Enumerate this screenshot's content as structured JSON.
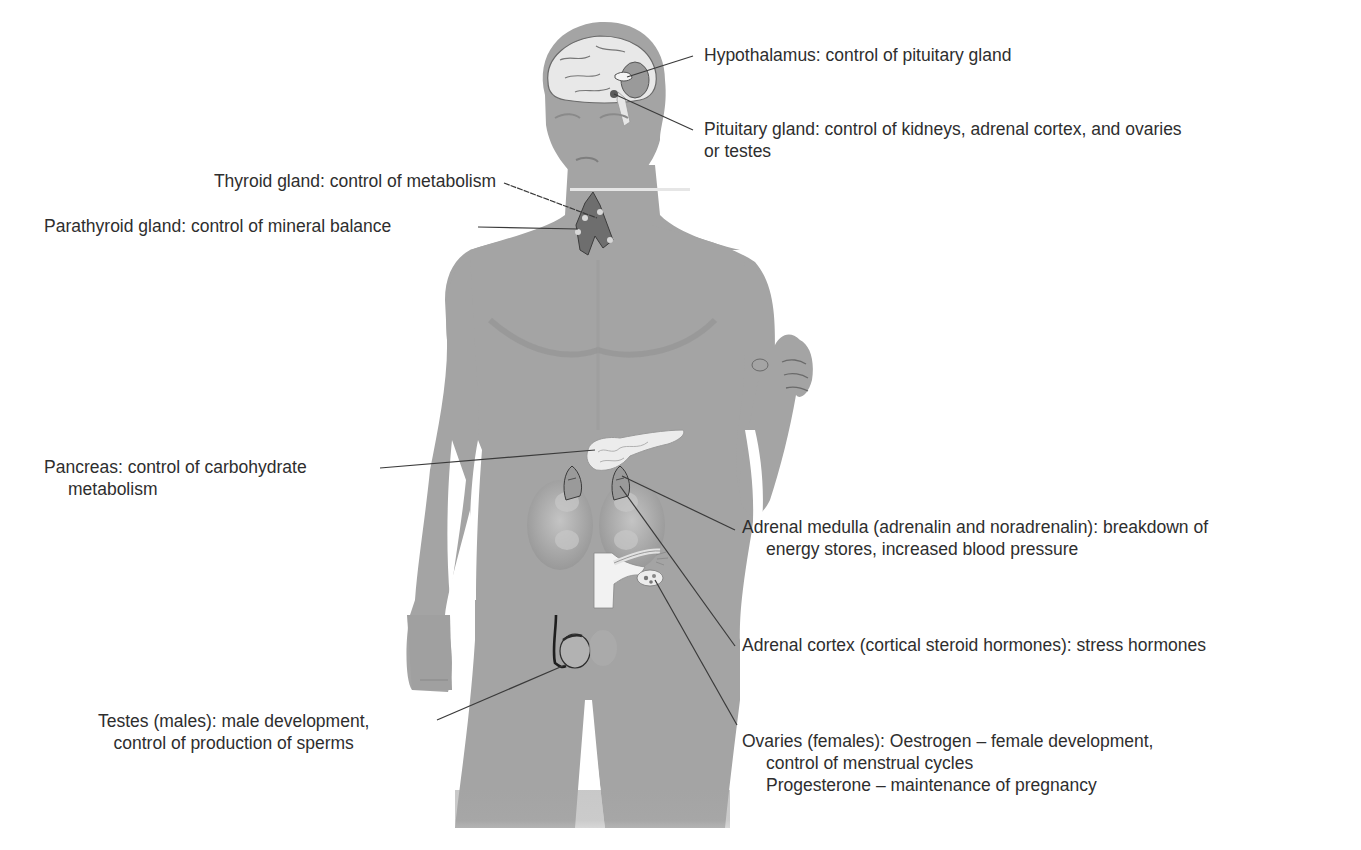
{
  "diagram": {
    "colors": {
      "background": "#ffffff",
      "body": "#a4a4a4",
      "body_shadow": "#939393",
      "organ_light": "#e6e6e6",
      "organ_outline": "#4a4a4a",
      "gland_dark": "#6e6e6e",
      "leader_line": "#3a3a3a",
      "text": "#2e2e2e"
    },
    "labels": {
      "hypothalamus": {
        "lines": [
          "Hypothalamus: control of pituitary gland"
        ]
      },
      "pituitary": {
        "lines": [
          "Pituitary gland: control of kidneys, adrenal cortex, and ovaries",
          "or testes"
        ]
      },
      "thyroid": {
        "lines": [
          "Thyroid gland: control of metabolism"
        ]
      },
      "parathyroid": {
        "lines": [
          "Parathyroid gland: control of mineral balance"
        ]
      },
      "pancreas": {
        "lines": [
          "Pancreas: control of carbohydrate",
          "metabolism"
        ]
      },
      "adrenal_medulla": {
        "lines": [
          "Adrenal medulla (adrenalin and noradrenalin): breakdown of",
          "energy stores, increased blood pressure"
        ]
      },
      "adrenal_cortex": {
        "lines": [
          "Adrenal cortex (cortical steroid hormones): stress hormones"
        ]
      },
      "testes": {
        "lines": [
          "Testes (males): male development,",
          "control of production of sperms"
        ]
      },
      "ovaries": {
        "lines": [
          "Ovaries (females): Oestrogen – female development,",
          "control of menstrual cycles",
          "Progesterone – maintenance of pregnancy"
        ]
      }
    }
  }
}
